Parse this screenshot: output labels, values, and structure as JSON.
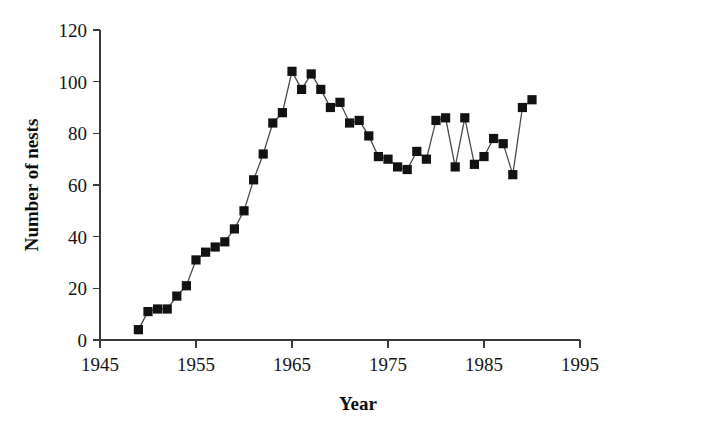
{
  "chart_data": {
    "type": "line",
    "title": "",
    "xlabel": "Year",
    "ylabel": "Number of nests",
    "xlim": [
      1945,
      1995
    ],
    "ylim": [
      0,
      120
    ],
    "grid": false,
    "legend": "none",
    "marker_style": "filled-square",
    "line_color": "#4a4a4a",
    "marker_color": "#121212",
    "xticks": [
      1945,
      1955,
      1965,
      1975,
      1985,
      1995
    ],
    "yticks": [
      0,
      20,
      40,
      60,
      80,
      100,
      120
    ],
    "xtick_labels": [
      "1945",
      "1955",
      "1965",
      "1975",
      "1985",
      "1995"
    ],
    "ytick_labels": [
      "0",
      "20",
      "40",
      "60",
      "80",
      "100",
      "120"
    ],
    "x": [
      1949,
      1950,
      1951,
      1952,
      1953,
      1954,
      1955,
      1956,
      1957,
      1958,
      1959,
      1960,
      1961,
      1962,
      1963,
      1964,
      1965,
      1966,
      1967,
      1968,
      1969,
      1970,
      1971,
      1972,
      1973,
      1974,
      1975,
      1976,
      1977,
      1978,
      1979,
      1980,
      1981,
      1982,
      1983,
      1984,
      1985,
      1986,
      1987,
      1988,
      1989,
      1990
    ],
    "values": [
      4,
      11,
      12,
      12,
      17,
      21,
      31,
      34,
      36,
      38,
      43,
      50,
      62,
      72,
      84,
      88,
      104,
      97,
      103,
      97,
      90,
      92,
      84,
      85,
      79,
      71,
      70,
      67,
      66,
      73,
      70,
      85,
      86,
      67,
      86,
      68,
      71,
      78,
      76,
      64,
      90,
      93
    ],
    "series": [
      {
        "name": "Number of nests",
        "values": [
          4,
          11,
          12,
          12,
          17,
          21,
          31,
          34,
          36,
          38,
          43,
          50,
          62,
          72,
          84,
          88,
          104,
          97,
          103,
          97,
          90,
          92,
          84,
          85,
          79,
          71,
          70,
          67,
          66,
          73,
          70,
          85,
          86,
          67,
          86,
          68,
          71,
          78,
          76,
          64,
          90,
          93
        ]
      }
    ]
  }
}
